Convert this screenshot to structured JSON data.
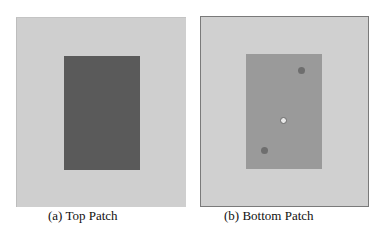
{
  "figure": {
    "panels": [
      {
        "id": "a",
        "caption": "(a) Top Patch",
        "background": "#cfcfcf",
        "patch_color": "#5a5a5a"
      },
      {
        "id": "b",
        "caption": "(b) Bottom Patch",
        "background": "#d0d0d0",
        "patch_color": "#9a9a9a",
        "markers": [
          {
            "type": "filled",
            "x": 100,
            "y": 53
          },
          {
            "type": "hollow",
            "x": 82,
            "y": 103
          },
          {
            "type": "filled",
            "x": 63,
            "y": 133
          }
        ]
      }
    ]
  }
}
